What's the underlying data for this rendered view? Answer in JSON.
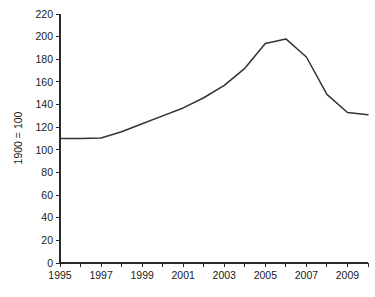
{
  "chart_data": {
    "type": "line",
    "title": "",
    "subtitle": "",
    "xlabel": "",
    "ylabel": "1900 = 100",
    "xlim": [
      1995,
      2010
    ],
    "ylim": [
      0,
      220
    ],
    "grid": false,
    "legend": false,
    "legend_position": "none",
    "y_ticks": [
      0,
      20,
      40,
      60,
      80,
      100,
      120,
      140,
      160,
      180,
      200,
      220
    ],
    "y_tick_labels": [
      "0",
      "20",
      "40",
      "60",
      "80",
      "100",
      "120",
      "140",
      "160",
      "180",
      "200",
      "220"
    ],
    "x_ticks": [
      1995,
      1996,
      1997,
      1998,
      1999,
      2000,
      2001,
      2002,
      2003,
      2004,
      2005,
      2006,
      2007,
      2008,
      2009,
      2010
    ],
    "x_tick_labels": [
      "1995",
      "",
      "1997",
      "",
      "1999",
      "",
      "2001",
      "",
      "2003",
      "",
      "2005",
      "",
      "2007",
      "",
      "2009",
      ""
    ],
    "x_labeled_ticks": [
      1995,
      1997,
      1999,
      2001,
      2003,
      2005,
      2007,
      2009
    ],
    "series": [
      {
        "name": "Index",
        "color": "#333333",
        "x": [
          1995,
          1996,
          1997,
          1998,
          1999,
          2000,
          2001,
          2002,
          2003,
          2004,
          2005,
          2006,
          2007,
          2008,
          2009,
          2010
        ],
        "values": [
          110,
          110,
          110.5,
          116,
          123,
          130,
          137,
          146,
          157,
          172,
          194,
          198,
          182,
          149,
          133,
          131
        ]
      }
    ]
  },
  "axis": {
    "y_title": "1900 = 100"
  }
}
